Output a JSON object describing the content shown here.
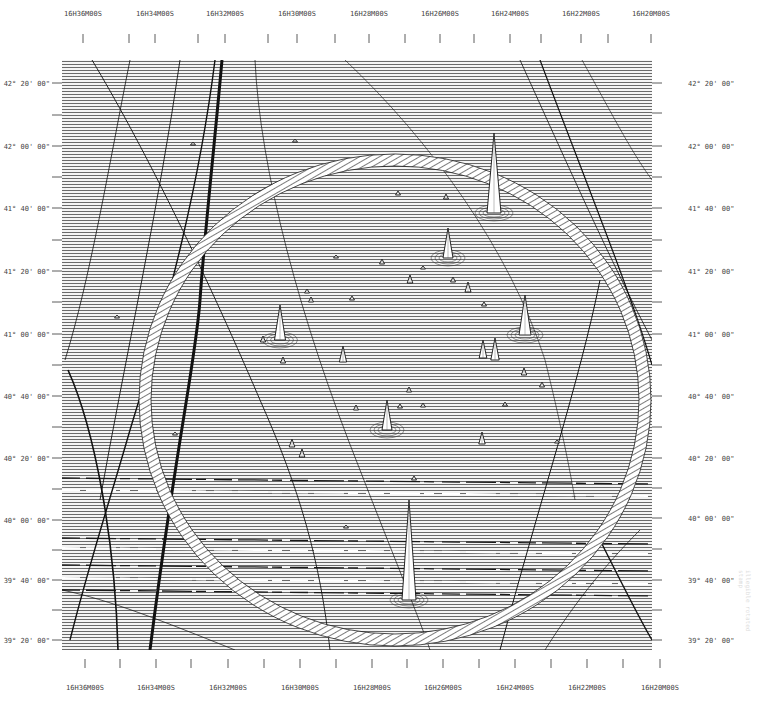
{
  "chart_data": {
    "type": "heatmap",
    "subtype": "ruled-surface (stacked raster line) map of radio sky brightness",
    "title": "",
    "xlabel": "Right Ascension",
    "ylabel": "Declination",
    "plot_area_px": {
      "x0": 62,
      "y0": 60,
      "x1": 652,
      "y1": 650
    },
    "x_axis_top": {
      "ticks": [
        {
          "label": "16H36M00S",
          "x": 83
        },
        {
          "label": "16H34M00S",
          "x": 155
        },
        {
          "label": "16H32M00S",
          "x": 225
        },
        {
          "label": "16H30M00S",
          "x": 297
        },
        {
          "label": "16H28M00S",
          "x": 369
        },
        {
          "label": "16H26M00S",
          "x": 440
        },
        {
          "label": "16H24M00S",
          "x": 510
        },
        {
          "label": "16H22M00S",
          "x": 581
        },
        {
          "label": "16H20M00S",
          "x": 651
        }
      ],
      "minor_ticks_x": [
        129,
        198,
        268,
        335,
        405,
        474,
        541,
        608
      ]
    },
    "x_axis_bottom": {
      "ticks": [
        {
          "label": "16H36M00S",
          "x": 85
        },
        {
          "label": "16H34M00S",
          "x": 156
        },
        {
          "label": "16H32M00S",
          "x": 228
        },
        {
          "label": "16H30M00S",
          "x": 300
        },
        {
          "label": "16H28M00S",
          "x": 372
        },
        {
          "label": "16H26M00S",
          "x": 443
        },
        {
          "label": "16H24M00S",
          "x": 515
        },
        {
          "label": "16H22M00S",
          "x": 587
        },
        {
          "label": "16H20M00S",
          "x": 660
        }
      ],
      "minor_ticks_x": [
        120,
        191,
        264,
        336,
        407,
        479,
        551,
        623
      ]
    },
    "y_axis_left": {
      "ticks": [
        {
          "label": "42° 20' 00\"",
          "y": 83
        },
        {
          "label": "42° 00' 00\"",
          "y": 146
        },
        {
          "label": "41° 40' 00\"",
          "y": 208
        },
        {
          "label": "41° 20' 00\"",
          "y": 271
        },
        {
          "label": "41° 00' 00\"",
          "y": 334
        },
        {
          "label": "40° 40' 00\"",
          "y": 396
        },
        {
          "label": "40° 20' 00\"",
          "y": 458
        },
        {
          "label": "40° 00' 00\"",
          "y": 520
        },
        {
          "label": "39° 40' 00\"",
          "y": 580
        },
        {
          "label": "39° 20' 00\"",
          "y": 640
        }
      ],
      "minor_ticks_y": [
        115,
        177,
        240,
        302,
        365,
        427,
        489,
        550,
        610
      ]
    },
    "y_axis_right": {
      "ticks": [
        {
          "label": "42° 20' 00\"",
          "y": 83
        },
        {
          "label": "42° 00' 00\"",
          "y": 146
        },
        {
          "label": "41° 40' 00\"",
          "y": 208
        },
        {
          "label": "41° 20' 00\"",
          "y": 271
        },
        {
          "label": "41° 00' 00\"",
          "y": 334
        },
        {
          "label": "40° 40' 00\"",
          "y": 396
        },
        {
          "label": "40° 20' 00\"",
          "y": 458
        },
        {
          "label": "40° 00' 00\"",
          "y": 518
        },
        {
          "label": "39° 40' 00\"",
          "y": 580
        },
        {
          "label": "39° 20' 00\"",
          "y": 640
        }
      ],
      "minor_ticks_y": [
        113,
        177,
        240,
        302,
        365,
        427,
        488,
        549,
        610
      ]
    },
    "x_range": [
      "16H37M",
      "16H20M"
    ],
    "y_range": [
      "39°15'",
      "42°25'"
    ],
    "grid": false,
    "legend": null,
    "ring": {
      "cx": 395,
      "cy": 400,
      "rx": 250,
      "ry": 240,
      "band_width": 12,
      "description": "bright elliptical ring (hatched band) around field center"
    },
    "sources": [
      {
        "x": 409,
        "y": 600,
        "height": 100,
        "strength": "strongest"
      },
      {
        "x": 494,
        "y": 213,
        "height": 80,
        "strength": "very strong"
      },
      {
        "x": 448,
        "y": 258,
        "height": 30,
        "strength": "strong"
      },
      {
        "x": 280,
        "y": 340,
        "height": 35,
        "strength": "strong"
      },
      {
        "x": 525,
        "y": 335,
        "height": 40,
        "strength": "strong"
      },
      {
        "x": 387,
        "y": 430,
        "height": 30,
        "strength": "strong"
      },
      {
        "x": 495,
        "y": 360,
        "height": 22,
        "strength": "medium"
      },
      {
        "x": 483,
        "y": 358,
        "height": 18,
        "strength": "medium"
      },
      {
        "x": 343,
        "y": 362,
        "height": 16,
        "strength": "medium"
      },
      {
        "x": 468,
        "y": 292,
        "height": 10,
        "strength": "weak"
      },
      {
        "x": 410,
        "y": 283,
        "height": 8,
        "strength": "weak"
      },
      {
        "x": 482,
        "y": 444,
        "height": 12,
        "strength": "weak"
      },
      {
        "x": 292,
        "y": 447,
        "height": 8,
        "strength": "weak"
      },
      {
        "x": 302,
        "y": 457,
        "height": 8,
        "strength": "weak"
      },
      {
        "x": 524,
        "y": 375,
        "height": 7,
        "strength": "weak"
      },
      {
        "x": 542,
        "y": 387,
        "height": 5,
        "strength": "weak"
      },
      {
        "x": 356,
        "y": 410,
        "height": 5,
        "strength": "weak"
      },
      {
        "x": 283,
        "y": 363,
        "height": 6,
        "strength": "weak"
      },
      {
        "x": 263,
        "y": 342,
        "height": 6,
        "strength": "weak"
      },
      {
        "x": 382,
        "y": 264,
        "height": 5,
        "strength": "weak"
      },
      {
        "x": 311,
        "y": 302,
        "height": 5,
        "strength": "weak"
      },
      {
        "x": 453,
        "y": 282,
        "height": 5,
        "strength": "weak"
      },
      {
        "x": 409,
        "y": 392,
        "height": 5,
        "strength": "weak"
      },
      {
        "x": 446,
        "y": 199,
        "height": 5,
        "strength": "weak"
      },
      {
        "x": 398,
        "y": 195,
        "height": 4,
        "strength": "weak"
      },
      {
        "x": 352,
        "y": 300,
        "height": 4,
        "strength": "weak"
      },
      {
        "x": 400,
        "y": 408,
        "height": 4,
        "strength": "weak"
      },
      {
        "x": 307,
        "y": 293,
        "height": 4,
        "strength": "weak"
      },
      {
        "x": 505,
        "y": 406,
        "height": 4,
        "strength": "weak"
      },
      {
        "x": 484,
        "y": 306,
        "height": 4,
        "strength": "weak"
      },
      {
        "x": 423,
        "y": 407,
        "height": 4,
        "strength": "weak"
      },
      {
        "x": 295,
        "y": 142,
        "height": 3,
        "strength": "weak"
      },
      {
        "x": 193,
        "y": 145,
        "height": 3,
        "strength": "weak"
      },
      {
        "x": 336,
        "y": 258,
        "height": 3,
        "strength": "weak"
      },
      {
        "x": 423,
        "y": 269,
        "height": 3,
        "strength": "weak"
      },
      {
        "x": 414,
        "y": 480,
        "height": 4,
        "strength": "weak"
      },
      {
        "x": 346,
        "y": 528,
        "height": 3,
        "strength": "weak"
      },
      {
        "x": 175,
        "y": 435,
        "height": 3,
        "strength": "weak"
      },
      {
        "x": 117,
        "y": 318,
        "height": 3,
        "strength": "weak"
      },
      {
        "x": 557,
        "y": 443,
        "height": 3,
        "strength": "weak"
      }
    ],
    "dark_streaks": [
      {
        "d": "M 222 60 C 214 150 204 240 200 300 C 196 360 175 450 150 650",
        "width": 3
      },
      {
        "d": "M 215 60 C 200 180 170 300 130 430 C 110 500 90 560 70 640",
        "width": 1.4
      },
      {
        "d": "M 180 60 C 160 200 125 360 100 500",
        "width": 0.9
      },
      {
        "d": "M 130 60 C 110 160 90 280 65 360",
        "width": 0.8
      },
      {
        "d": "M 68 370 C 95 430 115 540 118 650",
        "width": 1.6
      },
      {
        "d": "M 92 60 C 140 140 200 260 260 400 C 300 490 320 560 330 650",
        "width": 0.9
      },
      {
        "d": "M 255 60 C 260 170 300 320 360 470 C 395 560 420 620 430 650",
        "width": 0.7
      },
      {
        "d": "M 540 60 C 585 180 630 290 652 365",
        "width": 1.2
      },
      {
        "d": "M 520 60 C 570 170 610 260 652 340",
        "width": 0.8
      },
      {
        "d": "M 345 60 C 430 140 510 250 545 360 C 560 420 570 470 575 500",
        "width": 0.6
      },
      {
        "d": "M 600 280 C 580 380 540 500 500 650",
        "width": 1.0
      },
      {
        "d": "M 640 530 C 600 570 570 610 545 650",
        "width": 0.7
      },
      {
        "d": "M 582 60 C 610 110 630 150 652 180",
        "width": 0.6
      },
      {
        "d": "M 62 590 C 110 600 160 620 235 650",
        "width": 0.7
      },
      {
        "d": "M 600 540 C 620 580 640 620 652 640",
        "width": 1.4
      }
    ],
    "band_artifacts_y": [
      478,
      490,
      538,
      548,
      565,
      578,
      590
    ]
  },
  "annotations": {
    "right_margin_stamp": "illegible rotated stamp"
  }
}
